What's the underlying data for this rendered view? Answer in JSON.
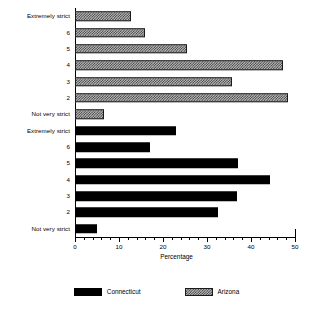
{
  "chart_data": {
    "type": "bar",
    "orientation": "horizontal",
    "title": "",
    "xlabel": "Percentage",
    "ylabel": "",
    "xlim": [
      0,
      50
    ],
    "xticks": [
      0,
      10,
      20,
      30,
      40,
      50
    ],
    "xtick_labels": [
      "0",
      "10",
      "20",
      "30",
      "40",
      "50"
    ],
    "minor_tick_step": 2,
    "grid": false,
    "legend_position": "bottom",
    "categories": [
      "Extremely strict",
      "6",
      "5",
      "4",
      "3",
      "2",
      "Not very strict"
    ],
    "series": [
      {
        "name": "Arizona",
        "fill": "hatched",
        "color": "#b9b9b9",
        "values": [
          12.7,
          15.9,
          25.5,
          47.3,
          35.7,
          48.4,
          6.6
        ]
      },
      {
        "name": "Connecticut",
        "fill": "solid",
        "color": "#000000",
        "values": [
          23.0,
          17.0,
          37.0,
          44.3,
          36.8,
          32.5,
          5.0
        ]
      }
    ],
    "group_order": [
      "Arizona",
      "Connecticut"
    ]
  },
  "axis": {
    "x_title": "Percentage"
  },
  "legend": {
    "entries": [
      {
        "label": "Connecticut",
        "swatch": "solid-black-swatch"
      },
      {
        "label": "Arizona",
        "swatch": "hatched-gray-swatch"
      }
    ]
  }
}
